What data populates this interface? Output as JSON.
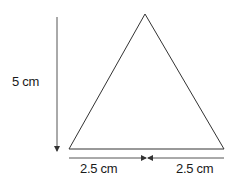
{
  "diagram": {
    "shape": "isosceles triangle",
    "labels": {
      "height": "5 cm",
      "left_half_base": "2.5 cm",
      "right_half_base": "2.5 cm"
    },
    "colors": {
      "stroke": "#333333",
      "text": "#1a1a1a",
      "background": "#ffffff"
    }
  }
}
